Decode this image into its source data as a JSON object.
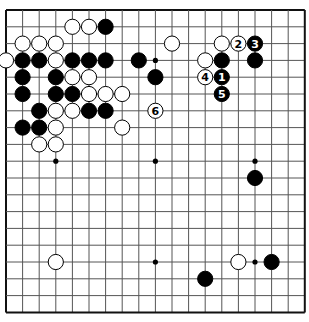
{
  "board": {
    "size": 19,
    "origin_x": 6,
    "origin_y": 10,
    "spacing_x": 16.6,
    "spacing_y": 16.8,
    "line_color": "#555555",
    "border_color": "#111111",
    "star_points": [
      [
        3,
        9
      ],
      [
        9,
        3
      ],
      [
        9,
        9
      ],
      [
        15,
        9
      ],
      [
        9,
        15
      ],
      [
        15,
        15
      ],
      [
        3,
        3
      ],
      [
        15,
        3
      ],
      [
        3,
        15
      ]
    ]
  },
  "stones": [
    {
      "c": 4,
      "r": 1,
      "color": "white"
    },
    {
      "c": 5,
      "r": 1,
      "color": "white"
    },
    {
      "c": 6,
      "r": 1,
      "color": "black"
    },
    {
      "c": 1,
      "r": 2,
      "color": "white"
    },
    {
      "c": 2,
      "r": 2,
      "color": "white"
    },
    {
      "c": 3,
      "r": 2,
      "color": "white"
    },
    {
      "c": 10,
      "r": 2,
      "color": "white"
    },
    {
      "c": 13,
      "r": 2,
      "color": "white"
    },
    {
      "c": 14,
      "r": 2,
      "color": "white",
      "label": "2"
    },
    {
      "c": 15,
      "r": 2,
      "color": "black",
      "label": "3"
    },
    {
      "c": 0,
      "r": 3,
      "color": "white"
    },
    {
      "c": 1,
      "r": 3,
      "color": "black"
    },
    {
      "c": 2,
      "r": 3,
      "color": "black"
    },
    {
      "c": 3,
      "r": 3,
      "color": "white"
    },
    {
      "c": 4,
      "r": 3,
      "color": "black"
    },
    {
      "c": 5,
      "r": 3,
      "color": "black"
    },
    {
      "c": 6,
      "r": 3,
      "color": "black"
    },
    {
      "c": 8,
      "r": 3,
      "color": "black"
    },
    {
      "c": 12,
      "r": 3,
      "color": "white"
    },
    {
      "c": 13,
      "r": 3,
      "color": "black"
    },
    {
      "c": 15,
      "r": 3,
      "color": "black"
    },
    {
      "c": 1,
      "r": 4,
      "color": "black"
    },
    {
      "c": 3,
      "r": 4,
      "color": "black"
    },
    {
      "c": 4,
      "r": 4,
      "color": "white"
    },
    {
      "c": 5,
      "r": 4,
      "color": "white"
    },
    {
      "c": 9,
      "r": 4,
      "color": "black"
    },
    {
      "c": 12,
      "r": 4,
      "color": "white",
      "label": "4"
    },
    {
      "c": 13,
      "r": 4,
      "color": "black",
      "label": "1"
    },
    {
      "c": 1,
      "r": 5,
      "color": "black"
    },
    {
      "c": 3,
      "r": 5,
      "color": "black"
    },
    {
      "c": 4,
      "r": 5,
      "color": "black"
    },
    {
      "c": 5,
      "r": 5,
      "color": "white"
    },
    {
      "c": 6,
      "r": 5,
      "color": "white"
    },
    {
      "c": 7,
      "r": 5,
      "color": "white"
    },
    {
      "c": 13,
      "r": 5,
      "color": "black",
      "label": "5"
    },
    {
      "c": 2,
      "r": 6,
      "color": "black"
    },
    {
      "c": 3,
      "r": 6,
      "color": "white"
    },
    {
      "c": 4,
      "r": 6,
      "color": "white"
    },
    {
      "c": 5,
      "r": 6,
      "color": "black"
    },
    {
      "c": 6,
      "r": 6,
      "color": "black"
    },
    {
      "c": 9,
      "r": 6,
      "color": "white",
      "label": "6"
    },
    {
      "c": 1,
      "r": 7,
      "color": "black"
    },
    {
      "c": 2,
      "r": 7,
      "color": "black"
    },
    {
      "c": 3,
      "r": 7,
      "color": "white"
    },
    {
      "c": 7,
      "r": 7,
      "color": "white"
    },
    {
      "c": 2,
      "r": 8,
      "color": "white"
    },
    {
      "c": 3,
      "r": 8,
      "color": "white"
    },
    {
      "c": 15,
      "r": 10,
      "color": "black"
    },
    {
      "c": 3,
      "r": 15,
      "color": "white"
    },
    {
      "c": 14,
      "r": 15,
      "color": "white"
    },
    {
      "c": 16,
      "r": 15,
      "color": "black"
    },
    {
      "c": 12,
      "r": 16,
      "color": "black"
    }
  ]
}
